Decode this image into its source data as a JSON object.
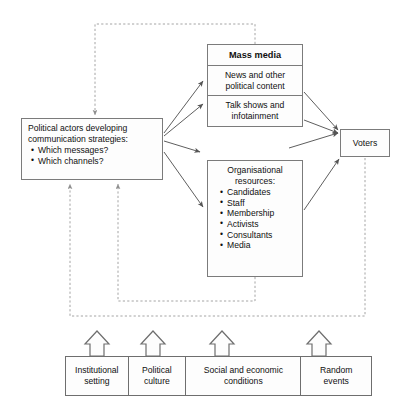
{
  "diagram": {
    "colors": {
      "background": "#ffffff",
      "box_fill": "#fdfdfd",
      "box_border": "#7b7b7b",
      "solid_arrow": "#555555",
      "dashed_arrow": "#9a9a9a",
      "text": "#101010"
    }
  },
  "nodes": {
    "political_actors": {
      "lead_line_1": "Political actors developing",
      "lead_line_2": "communication strategies:",
      "bullets": [
        "Which messages?",
        "Which channels?"
      ]
    },
    "mass_media": {
      "header": "Mass media",
      "cells": [
        "News and other political content",
        "Talk shows and infotainment"
      ]
    },
    "organisational_resources": {
      "title_line_1": "Organisational",
      "title_line_2": "resources:",
      "bullets": [
        "Candidates",
        "Staff",
        "Membership",
        "Activists",
        "Consultants",
        "Media"
      ]
    },
    "voters": {
      "label": "Voters"
    }
  },
  "context_band": {
    "cells": [
      {
        "line_1": "Institutional",
        "line_2": "setting"
      },
      {
        "line_1": "Political",
        "line_2": "culture"
      },
      {
        "line_1": "Social and economic",
        "line_2": "conditions"
      },
      {
        "line_1": "Random",
        "line_2": "events"
      }
    ]
  },
  "connections": {
    "solid": [
      {
        "from": "political_actors",
        "to": "mass_media_news"
      },
      {
        "from": "political_actors",
        "to": "mass_media_talkshows"
      },
      {
        "from": "political_actors",
        "to": "voters"
      },
      {
        "from": "political_actors",
        "to": "organisational_resources"
      },
      {
        "from": "mass_media_news",
        "to": "voters"
      },
      {
        "from": "mass_media_talkshows",
        "to": "voters"
      },
      {
        "from": "organisational_resources",
        "to": "voters"
      }
    ],
    "dashed_feedback": [
      {
        "from": "mass_media",
        "to": "political_actors"
      },
      {
        "from": "organisational_resources",
        "to": "political_actors"
      },
      {
        "from": "voters",
        "to": "political_actors"
      }
    ],
    "context_influence": [
      {
        "from": "institutional_setting",
        "to": "process"
      },
      {
        "from": "political_culture",
        "to": "process"
      },
      {
        "from": "social_and_economic_conditions",
        "to": "process"
      },
      {
        "from": "random_events",
        "to": "process"
      }
    ]
  }
}
